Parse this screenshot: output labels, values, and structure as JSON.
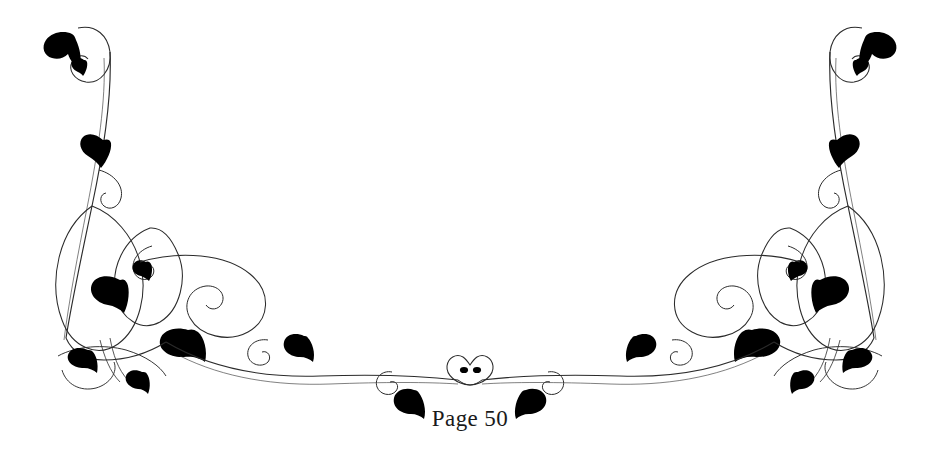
{
  "document": {
    "page_label": "Page 50",
    "background_color": "#ffffff"
  },
  "ornament": {
    "name": "floral-flourish-divider",
    "description": "Symmetrical calligraphic vine flourish with solid black leaf accents spanning the page width above the page number",
    "stroke_color": "#2b2b2b",
    "leaf_fill_color": "#000000",
    "stroke_width": "1",
    "symmetry": "horizontal-mirror",
    "center_motif": "heart-loop-with-two-dots"
  }
}
